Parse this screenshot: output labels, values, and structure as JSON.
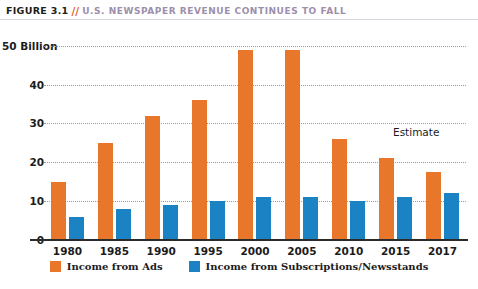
{
  "header": {
    "figure_label": "FIGURE 3.1",
    "separator": "//",
    "title": "U.S. NEWSPAPER REVENUE CONTINUES TO FALL"
  },
  "annotations": {
    "estimate": "Estimate"
  },
  "source_note": "",
  "colors": {
    "ads": "#e8762b",
    "subs": "#1b82c4",
    "title_accent": "#e0662a",
    "title_text": "#9d8fab",
    "axis": "#2b2b2b",
    "gridline": "#9b9b9b"
  },
  "chart_data": {
    "type": "bar",
    "title": "U.S. NEWSPAPER REVENUE CONTINUES TO FALL",
    "xlabel": "",
    "ylabel": "",
    "ylim": [
      0,
      52
    ],
    "grid": true,
    "legend_position": "bottom",
    "y_ticks": [
      0,
      10,
      20,
      30,
      40,
      50
    ],
    "y_tick_labels": [
      "0",
      "10",
      "20",
      "30",
      "40",
      "50 Billion"
    ],
    "categories": [
      "1980",
      "1985",
      "1990",
      "1995",
      "2000",
      "2005",
      "2010",
      "2015",
      "2017"
    ],
    "series": [
      {
        "name": "Income from Ads",
        "color": "#e8762b",
        "values": [
          15,
          25,
          32,
          36,
          49,
          49,
          26,
          21,
          17.5
        ]
      },
      {
        "name": "Income from Subscriptions/Newsstands",
        "color": "#1b82c4",
        "values": [
          6,
          8,
          9,
          10,
          11,
          11,
          10,
          11,
          12
        ]
      }
    ],
    "annotations": [
      {
        "text": "Estimate",
        "near_category": "2017"
      }
    ]
  }
}
